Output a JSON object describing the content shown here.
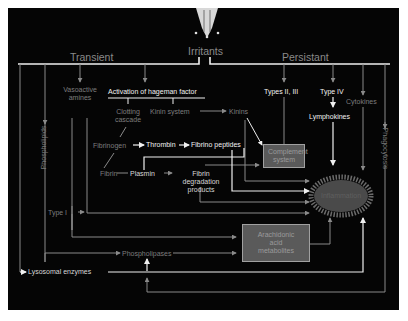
{
  "diagram": {
    "title_node": "Irritants",
    "branches": {
      "left": "Transient",
      "right": "Persistant"
    },
    "nodes": {
      "vasoactive_amines": "Vasoactive amines",
      "hageman": "Activation of hageman factor",
      "clotting_cascade": "Clotting cascade",
      "kinin_system": "Kinin system",
      "kinins": "Kinins",
      "fibrinogen": "Fibrinogen",
      "thrombin": "Thrombin",
      "fibrino_peptides": "Fibrino peptides",
      "fibrin": "Fibrin",
      "plasmin": "Plasmin",
      "fibrin_degradation_products": "Fibrin degradation products",
      "complement_system": "Complement system",
      "types_2_3": "Types II, III",
      "type_4": "Type IV",
      "lymphokines": "Lymphokines",
      "cytokines": "Cytokines",
      "phagocytosis": "Phagocytosis",
      "phospholipids": "Phospholipids",
      "type_1": "Type I",
      "phospholipases": "Phospholipases",
      "arachidonic_acid_metabolites": "Arachidonic acid metabolites",
      "lysosomal_enzymes": "Lysosomal enzymes",
      "inflammation": "Inflammation"
    },
    "colors": {
      "background": "#050505",
      "frame": "#ffffff",
      "bright_line": "#f0f0f0",
      "dim_line": "#8a8a8a",
      "box_fill": "#5a5a5a",
      "inflammation_fill": "#4a4a4a"
    },
    "icons": {
      "irritant": "pipette-drop-icon"
    }
  }
}
